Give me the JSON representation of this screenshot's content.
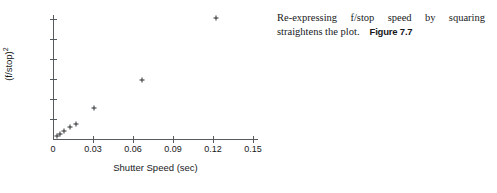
{
  "caption": {
    "body": "Re-expressing f/stop speed by squaring straightens the plot.",
    "figure_number": "Figure 7.7"
  },
  "chart_data": {
    "type": "scatter",
    "title": "",
    "xlabel": "Shutter Speed (sec)",
    "ylabel": "(f/stop)²",
    "ylabel_base": "(f/stop)",
    "ylabel_exponent": "2",
    "xlim": [
      0,
      0.15
    ],
    "ylim": [
      0,
      1200
    ],
    "grid": false,
    "legend": null,
    "marker": "plus",
    "marker_color": "#2b2e31",
    "axis_color": "#555a5e",
    "xticks": [
      0,
      0.03,
      0.06,
      0.09,
      0.12,
      0.15
    ],
    "xticklabels": [
      "0",
      "0.03",
      "0.06",
      "0.09",
      "0.12",
      "0.15"
    ],
    "yticks": [
      200,
      400,
      600,
      800,
      1000,
      1200
    ],
    "yticklabels": [
      "200",
      "400",
      "600",
      "800",
      "1000",
      "1200"
    ],
    "points": [
      {
        "x": 0.003,
        "y": 32
      },
      {
        "x": 0.005,
        "y": 50
      },
      {
        "x": 0.008,
        "y": 81
      },
      {
        "x": 0.0125,
        "y": 123
      },
      {
        "x": 0.0175,
        "y": 151
      },
      {
        "x": 0.031,
        "y": 310
      },
      {
        "x": 0.0665,
        "y": 590
      },
      {
        "x": 0.1225,
        "y": 1215
      }
    ]
  }
}
